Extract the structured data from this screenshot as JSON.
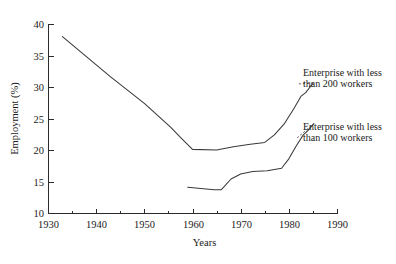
{
  "chart_data": {
    "type": "line",
    "title": "",
    "subtitle": "",
    "xlabel": "Years",
    "ylabel": "Employment (%)",
    "xlim": [
      1930,
      1990
    ],
    "ylim": [
      10,
      40
    ],
    "x_ticks": [
      1930,
      1940,
      1950,
      1960,
      1970,
      1980,
      1990
    ],
    "x_tick_labels": [
      "1930",
      "1940",
      "1950",
      "1960",
      "1970",
      "1980",
      "1990"
    ],
    "x_minor_ticks": [
      1935,
      1945,
      1955,
      1965,
      1975,
      1985
    ],
    "y_ticks": [
      10,
      15,
      20,
      25,
      30,
      35,
      40
    ],
    "y_tick_labels": [
      "10",
      "15",
      "20",
      "25",
      "30",
      "35",
      "40"
    ],
    "grid": false,
    "legend_position": "inline-annotation-right",
    "series": [
      {
        "name": "Enterprise with less than 200 workers",
        "label": "Enterprise with less than 200 workers",
        "label_line1": "Enterprise with less",
        "label_line2": "than 200 workers",
        "color": "#3a3a3a",
        "points": [
          [
            1933.0,
            38.0
          ],
          [
            1943.0,
            31.6
          ],
          [
            1950.0,
            27.4
          ],
          [
            1955.5,
            23.6
          ],
          [
            1957.5,
            22.0
          ],
          [
            1960.0,
            20.1
          ],
          [
            1965.0,
            20.0
          ],
          [
            1968.5,
            20.5
          ],
          [
            1972.0,
            20.9
          ],
          [
            1975.0,
            21.2
          ],
          [
            1977.0,
            22.4
          ],
          [
            1979.0,
            24.1
          ],
          [
            1981.0,
            26.5
          ],
          [
            1982.5,
            28.5
          ],
          [
            1983.5,
            29.1
          ],
          [
            1985.0,
            30.6
          ]
        ]
      },
      {
        "name": "Enterprise with less than 100 workers",
        "label": "Enterprise with less than 100 workers",
        "label_line1": "Enterprise with less",
        "label_line2": "than 100 workers",
        "color": "#3a3a3a",
        "points": [
          [
            1959.0,
            14.1
          ],
          [
            1964.5,
            13.7
          ],
          [
            1966.0,
            13.7
          ],
          [
            1968.0,
            15.4
          ],
          [
            1970.0,
            16.2
          ],
          [
            1972.5,
            16.6
          ],
          [
            1975.5,
            16.7
          ],
          [
            1978.5,
            17.1
          ],
          [
            1980.0,
            18.6
          ],
          [
            1981.5,
            20.6
          ],
          [
            1983.0,
            22.4
          ],
          [
            1984.0,
            23.1
          ],
          [
            1985.2,
            24.2
          ]
        ]
      }
    ],
    "annotations": [
      {
        "name": "annotation-200-workers",
        "text_line1": "Enterprise with less",
        "text_line2": "than 200 workers",
        "anchor_x": 1985.0,
        "anchor_y": 30.6
      },
      {
        "name": "annotation-100-workers",
        "text_line1": "Enterprise with less",
        "text_line2": "than 100 workers",
        "anchor_x": 1985.2,
        "anchor_y": 24.2
      }
    ]
  },
  "style": {
    "background": "#ffffff",
    "line_color": "#3a3a3a",
    "axis_color": "#2b2b2b",
    "text_color": "#1a1a1a"
  }
}
